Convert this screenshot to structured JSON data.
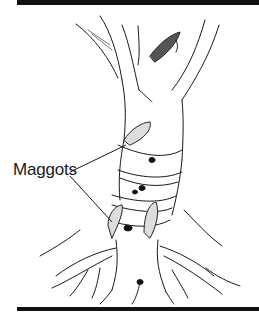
{
  "figure": {
    "label": "Maggots",
    "colors": {
      "ink": "#111111",
      "background": "#ffffff"
    }
  }
}
